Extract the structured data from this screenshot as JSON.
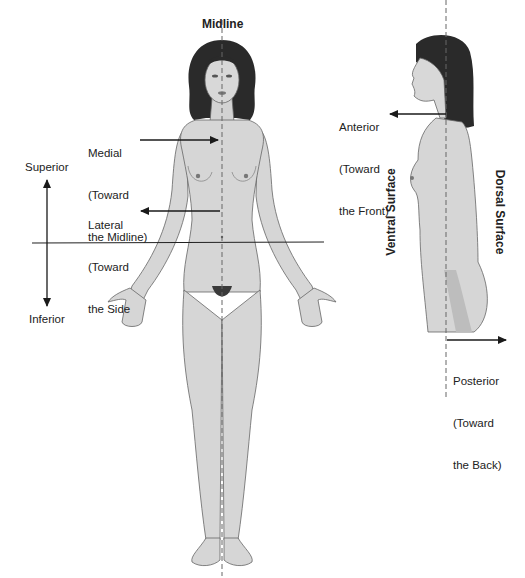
{
  "diagram": {
    "labels": {
      "midline": "Midline",
      "medial": [
        "Medial",
        "(Toward",
        "the Midline)"
      ],
      "lateral": [
        "Lateral",
        "(Toward",
        "the Side"
      ],
      "superior": "Superior",
      "inferior": "Inferior",
      "anterior": [
        "Anterior",
        "(Toward",
        "the Front)"
      ],
      "posterior": [
        "Posterior",
        "(Toward",
        "the Back)"
      ],
      "ventral_surface": "Ventral Surface",
      "dorsal_surface": "Dorsal Surface"
    },
    "colors": {
      "skin": "#d6d6d6",
      "skin_shade": "#bdbdbd",
      "hair": "#2a2a2a",
      "outline": "#555555",
      "arrow": "#1a1a1a",
      "midline_dash": "#666666"
    },
    "figures": [
      {
        "name": "front-view-figure",
        "view": "anterior"
      },
      {
        "name": "side-view-figure",
        "view": "lateral"
      }
    ]
  }
}
